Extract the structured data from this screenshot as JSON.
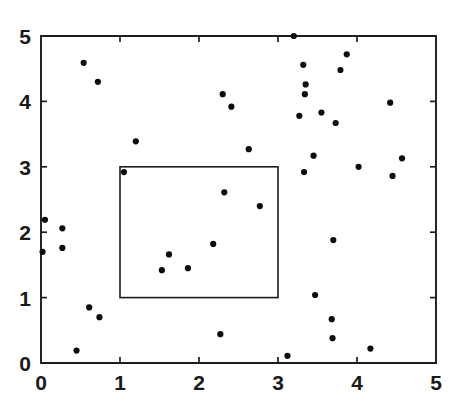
{
  "chart_data": {
    "type": "scatter",
    "title": "",
    "subtitle": "",
    "xlabel": "",
    "ylabel": "",
    "xlim": [
      0,
      5
    ],
    "ylim": [
      0,
      5
    ],
    "xticks": [
      0,
      1,
      2,
      3,
      4,
      5
    ],
    "yticks": [
      0,
      1,
      2,
      3,
      4,
      5
    ],
    "xtick_labels": [
      "0",
      "1",
      "2",
      "3",
      "4",
      "5"
    ],
    "ytick_labels": [
      "0",
      "1",
      "2",
      "3",
      "4",
      "5"
    ],
    "grid": false,
    "legend": null,
    "legend_position": "none",
    "marker": "filled-circle",
    "marker_color": "#0d0d0d",
    "marker_size_px": 3.1,
    "frame_color": "#1c1c1c",
    "background_color": "#ffffff",
    "annotations": [
      {
        "name": "inner-window-rectangle",
        "shape": "rectangle",
        "x0": 1.0,
        "y0": 1.0,
        "x1": 3.0,
        "y1": 3.0,
        "fill": "none",
        "stroke": "#1c1c1c"
      }
    ],
    "points": [
      {
        "x": 0.05,
        "y": 2.19
      },
      {
        "x": 0.02,
        "y": 1.7
      },
      {
        "x": 0.27,
        "y": 2.06
      },
      {
        "x": 0.27,
        "y": 1.76
      },
      {
        "x": 0.54,
        "y": 4.59
      },
      {
        "x": 0.61,
        "y": 0.85
      },
      {
        "x": 0.72,
        "y": 4.3
      },
      {
        "x": 0.74,
        "y": 0.7
      },
      {
        "x": 0.45,
        "y": 0.19
      },
      {
        "x": 1.05,
        "y": 2.92
      },
      {
        "x": 1.2,
        "y": 3.39
      },
      {
        "x": 1.53,
        "y": 1.42
      },
      {
        "x": 1.62,
        "y": 1.66
      },
      {
        "x": 1.86,
        "y": 1.45
      },
      {
        "x": 2.18,
        "y": 1.82
      },
      {
        "x": 2.27,
        "y": 0.44
      },
      {
        "x": 2.3,
        "y": 4.11
      },
      {
        "x": 2.32,
        "y": 2.61
      },
      {
        "x": 2.41,
        "y": 3.92
      },
      {
        "x": 2.63,
        "y": 3.27
      },
      {
        "x": 2.77,
        "y": 2.4
      },
      {
        "x": 3.12,
        "y": 0.11
      },
      {
        "x": 3.2,
        "y": 5.0
      },
      {
        "x": 3.27,
        "y": 3.78
      },
      {
        "x": 3.33,
        "y": 2.92
      },
      {
        "x": 3.32,
        "y": 4.56
      },
      {
        "x": 3.34,
        "y": 4.11
      },
      {
        "x": 3.35,
        "y": 4.26
      },
      {
        "x": 3.45,
        "y": 3.17
      },
      {
        "x": 3.47,
        "y": 1.04
      },
      {
        "x": 3.55,
        "y": 3.83
      },
      {
        "x": 3.68,
        "y": 0.67
      },
      {
        "x": 3.69,
        "y": 0.38
      },
      {
        "x": 3.7,
        "y": 1.88
      },
      {
        "x": 3.73,
        "y": 3.67
      },
      {
        "x": 3.79,
        "y": 4.48
      },
      {
        "x": 3.87,
        "y": 4.72
      },
      {
        "x": 4.02,
        "y": 3.0
      },
      {
        "x": 4.17,
        "y": 0.22
      },
      {
        "x": 4.42,
        "y": 3.98
      },
      {
        "x": 4.45,
        "y": 2.86
      },
      {
        "x": 4.57,
        "y": 3.13
      }
    ]
  },
  "figure": {
    "name": "scatter-plot-with-inner-window"
  }
}
